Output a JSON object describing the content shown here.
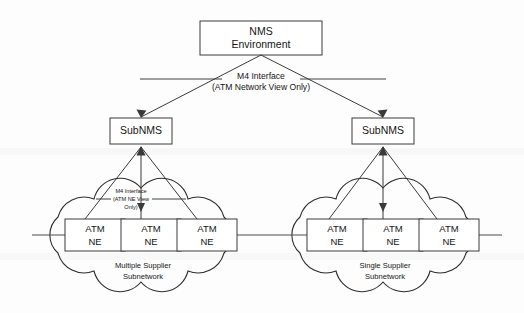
{
  "diagram": {
    "title_node": {
      "label_line1": "NMS",
      "label_line2": "Environment"
    },
    "top_interface": {
      "label_line1": "M4 Interface",
      "label_line2": "(ATM Network View Only)"
    },
    "sub_nms_left": {
      "label": "SubNMS"
    },
    "sub_nms_right": {
      "label": "SubNMS"
    },
    "inner_interface": {
      "label_line1": "M4 Interface",
      "label_line2": "(ATM NE View",
      "label_line3": "Only)"
    },
    "left_cloud": {
      "caption_line1": "Multiple Supplier",
      "caption_line2": "Subnetwork",
      "nodes": [
        {
          "line1": "ATM",
          "line2": "NE"
        },
        {
          "line1": "ATM",
          "line2": "NE"
        },
        {
          "line1": "ATM",
          "line2": "NE"
        }
      ]
    },
    "right_cloud": {
      "caption_line1": "Single Supplier",
      "caption_line2": "Subnetwork",
      "nodes": [
        {
          "line1": "ATM",
          "line2": "NE"
        },
        {
          "line1": "ATM",
          "line2": "NE"
        },
        {
          "line1": "ATM",
          "line2": "NE"
        }
      ]
    },
    "colors": {
      "stroke": "#3a3a3a",
      "cloud_stroke": "#2e2e2e",
      "text": "#151515",
      "background": "#fdfdfd"
    }
  }
}
